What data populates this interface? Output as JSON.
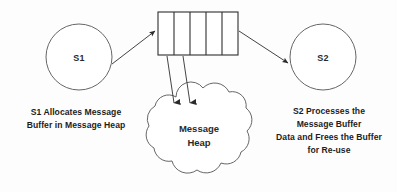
{
  "diagram": {
    "background_color": "#fdfdfd",
    "stroke_color": "#3a3a3a",
    "nodes": {
      "sender": {
        "label": "S1",
        "shape": "circle",
        "cx": 79,
        "cy": 57,
        "r": 33
      },
      "receiver": {
        "label": "S2",
        "shape": "circle",
        "cx": 323,
        "cy": 57,
        "r": 33
      },
      "heap": {
        "label_line1": "Message",
        "label_line2": "Heap",
        "shape": "cloud"
      },
      "buffer": {
        "name": "message-buffer",
        "shape": "segmented-rectangle",
        "cell_count": 5,
        "x": 158,
        "y": 12,
        "width": 80,
        "height": 43
      }
    },
    "captions": {
      "left": {
        "line1": "S1 Allocates Message",
        "line2": "Buffer in Message Heap"
      },
      "right": {
        "line1": "S2 Processes the",
        "line2": "Message Buffer",
        "line3": "Data and Frees the Buffer",
        "line4": "for Re-use"
      }
    },
    "connectors": [
      {
        "name": "s1-to-buffer",
        "from": "sender",
        "to": "buffer",
        "direction": "right"
      },
      {
        "name": "buffer-to-s2",
        "from": "buffer",
        "to": "receiver",
        "direction": "right"
      },
      {
        "name": "buffer-to-heap-1",
        "from": "buffer",
        "to": "heap",
        "direction": "down"
      },
      {
        "name": "buffer-to-heap-2",
        "from": "buffer",
        "to": "heap",
        "direction": "down"
      }
    ]
  }
}
